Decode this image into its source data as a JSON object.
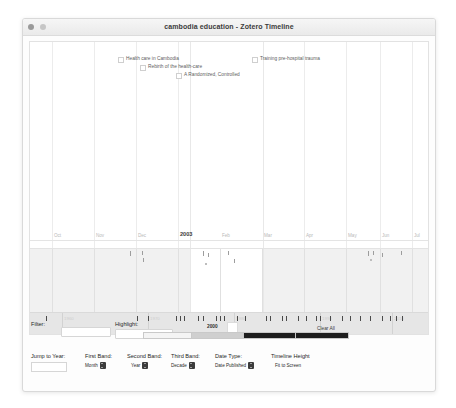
{
  "window": {
    "title": "cambodia education - Zotero Timeline",
    "traffic_lights": [
      "close-button",
      "minimize-button"
    ]
  },
  "timeline": {
    "events": [
      {
        "label": "Health care in Cambodia",
        "left": 88,
        "top": 14
      },
      {
        "label": "Rebirth of the health-care",
        "left": 110,
        "top": 22
      },
      {
        "label": "A Randomized, Controlled",
        "left": 146,
        "top": 30
      },
      {
        "label": "Training pre-hospital trauma",
        "left": 222,
        "top": 14
      }
    ],
    "month_ticks": [
      {
        "label": "Oct",
        "left": 22
      },
      {
        "label": "Nov",
        "left": 64
      },
      {
        "label": "Dec",
        "left": 106
      },
      {
        "label": "2003",
        "left": 148,
        "major": true
      },
      {
        "label": "Feb",
        "left": 190
      },
      {
        "label": "Mar",
        "left": 232
      },
      {
        "label": "Apr",
        "left": 274
      },
      {
        "label": "May",
        "left": 316
      },
      {
        "label": "Jun",
        "left": 350
      },
      {
        "label": "Jul",
        "left": 382
      }
    ],
    "decade_ticks": [
      {
        "label": "1960",
        "left": 32
      },
      {
        "label": "1970",
        "left": 118
      },
      {
        "label": "1980",
        "left": 204
      },
      {
        "label": "1990",
        "left": 290
      },
      {
        "label": "2010",
        "left": 362
      }
    ],
    "focus_year": "2000"
  },
  "controls": {
    "filter_label": "Filter:",
    "filter_value": "",
    "highlight_label": "Highlight:",
    "highlight_value": "",
    "clear_all_label": "Clear All",
    "highlight_swatches": [
      "#f4f4f4",
      "#cfcfcf",
      "#1d1d1d",
      "#1d1d1d"
    ],
    "jump_to_year_label": "Jump to Year:",
    "jump_to_year_value": "",
    "first_band_label": "First Band:",
    "first_band_value": "Month",
    "second_band_label": "Second Band:",
    "second_band_value": "Year",
    "third_band_label": "Third Band:",
    "third_band_value": "Decade",
    "date_type_label": "Date Type:",
    "date_type_value": "Date Published",
    "timeline_height_label": "Timeline Height",
    "timeline_height_value": "Fit to Screen"
  }
}
